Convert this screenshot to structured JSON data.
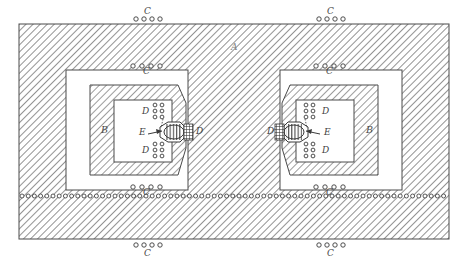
{
  "figure": {
    "kind": "patent-drawing",
    "width": 468,
    "height": 265,
    "background": "#ffffff",
    "ink": "#3a3a3a",
    "hatch_color": "#6e6e6e"
  },
  "labels": {
    "A": "A",
    "B": "B",
    "C": "C",
    "D": "D",
    "E": "E"
  },
  "callouts": [
    {
      "id": "a-outer-shell",
      "text": "A",
      "x": 234,
      "y": 48,
      "part": "outer shell / casing"
    },
    {
      "id": "c-top-outer",
      "text": "C",
      "x": 146,
      "y": 14,
      "part": "rivet row, outer top left"
    },
    {
      "id": "c-top-outer-right",
      "text": "C",
      "x": 329,
      "y": 14,
      "part": "rivet row, outer top right"
    },
    {
      "id": "c-bottom-outer",
      "text": "C",
      "x": 146,
      "y": 258,
      "part": "rivet row, outer bottom left"
    },
    {
      "id": "c-bottom-outer-right",
      "text": "C",
      "x": 329,
      "y": 258,
      "part": "rivet row, outer bottom right"
    },
    {
      "id": "c-top-inner-left",
      "text": "C",
      "x": 146,
      "y": 76,
      "part": "rivet row, inner top left"
    },
    {
      "id": "c-top-inner-right",
      "text": "C",
      "x": 329,
      "y": 76,
      "part": "rivet row, inner top right"
    },
    {
      "id": "c-bottom-inner-left",
      "text": "C",
      "x": 146,
      "y": 196,
      "part": "rivet row, inner bottom left"
    },
    {
      "id": "c-bottom-inner-right",
      "text": "C",
      "x": 329,
      "y": 196,
      "part": "rivet row, inner bottom right"
    },
    {
      "id": "b-left",
      "text": "B",
      "x": 104,
      "y": 129,
      "part": "inner hatched block, left"
    },
    {
      "id": "b-right",
      "text": "B",
      "x": 371,
      "y": 129,
      "part": "inner hatched block, right"
    },
    {
      "id": "d-left-upper",
      "text": "D",
      "x": 144,
      "y": 113,
      "part": "rivet column, left upper"
    },
    {
      "id": "d-left-lower",
      "text": "D",
      "x": 144,
      "y": 148,
      "part": "rivet column, left lower"
    },
    {
      "id": "d-left-outer",
      "text": "D",
      "x": 189,
      "y": 132,
      "part": "central column, left face"
    },
    {
      "id": "d-right-upper",
      "text": "D",
      "x": 330,
      "y": 113,
      "part": "rivet column, right upper"
    },
    {
      "id": "d-right-lower",
      "text": "D",
      "x": 330,
      "y": 148,
      "part": "rivet column, right lower"
    },
    {
      "id": "d-right-outer",
      "text": "D",
      "x": 279,
      "y": 132,
      "part": "central column, right face"
    },
    {
      "id": "e-left",
      "text": "E",
      "x": 128,
      "y": 137,
      "part": "capsule / bearing element, left"
    },
    {
      "id": "e-right",
      "text": "E",
      "x": 331,
      "y": 137,
      "part": "capsule / bearing element, right"
    }
  ],
  "geometry": {
    "outer_rect": {
      "x": 19,
      "y": 24,
      "w": 430,
      "h": 215
    },
    "rivet_seam_y": 196,
    "white_box_left": {
      "x": 66,
      "y": 70,
      "w": 122,
      "h": 120
    },
    "white_box_right": {
      "x": 287,
      "y": 70,
      "w": 122,
      "h": 120
    },
    "hatch_block_left": {
      "x": 90,
      "y": 85,
      "w": 96,
      "h": 90
    },
    "hatch_block_right": {
      "x": 289,
      "y": 85,
      "w": 96,
      "h": 90
    },
    "inner_white_left": {
      "x": 114,
      "y": 100,
      "w": 62,
      "h": 62
    },
    "inner_white_right": {
      "x": 299,
      "y": 100,
      "w": 62,
      "h": 62
    },
    "center_column": {
      "x": 188,
      "y": 24,
      "w": 92,
      "h": 215
    }
  },
  "rivet_rows": {
    "outer_top_left": {
      "cx": [
        136,
        144,
        152,
        160
      ],
      "cy": 19,
      "r": 2.2,
      "count": 4
    },
    "outer_top_right": {
      "cx": [
        319,
        327,
        335,
        343
      ],
      "cy": 19,
      "r": 2.2,
      "count": 4
    },
    "outer_bottom_left": {
      "cx": [
        136,
        144,
        152,
        160
      ],
      "cy": 245,
      "r": 2.2,
      "count": 4
    },
    "outer_bottom_right": {
      "cx": [
        319,
        327,
        335,
        343
      ],
      "cy": 245,
      "r": 2.2,
      "count": 4
    },
    "inner_top_left": {
      "cx": [
        133,
        142,
        151,
        160
      ],
      "cy": 66,
      "r": 2.2,
      "count": 4
    },
    "inner_top_right": {
      "cx": [
        316,
        325,
        334,
        343
      ],
      "cy": 66,
      "r": 2.2,
      "count": 4
    },
    "inner_bottom_left": {
      "cx": [
        133,
        142,
        151,
        160
      ],
      "cy": 187,
      "r": 2.2,
      "count": 4
    },
    "inner_bottom_right": {
      "cx": [
        316,
        325,
        334,
        343
      ],
      "cy": 187,
      "r": 2.2,
      "count": 4
    },
    "seam_row": {
      "y": 196,
      "x_start": 22,
      "x_end": 447,
      "spacing": 6.2,
      "r": 2.0
    }
  },
  "rivet_columns": {
    "left_upper": {
      "x": [
        154,
        161
      ],
      "y_start": 104,
      "count": 3,
      "spacing": 6,
      "r": 1.9
    },
    "left_lower": {
      "x": [
        154,
        161
      ],
      "y_start": 143,
      "count": 3,
      "spacing": 6,
      "r": 1.9
    },
    "right_upper": {
      "x": [
        307,
        314
      ],
      "y_start": 104,
      "count": 3,
      "spacing": 6,
      "r": 1.9
    },
    "right_lower": {
      "x": [
        307,
        314
      ],
      "y_start": 143,
      "count": 3,
      "spacing": 6,
      "r": 1.9
    }
  },
  "chart_data": {
    "type": "table",
    "columns": [
      "Ref",
      "Description",
      "Occurrences"
    ],
    "rows": [
      [
        "A",
        "Outer hatched shell / casing",
        1
      ],
      [
        "B",
        "Inner hatched chamber block",
        2
      ],
      [
        "C",
        "Rivet / fastener rows along seams",
        9
      ],
      [
        "D",
        "Rivet columns and central column faces",
        6
      ],
      [
        "E",
        "Central capsule element with arrow pointer",
        2
      ]
    ]
  }
}
